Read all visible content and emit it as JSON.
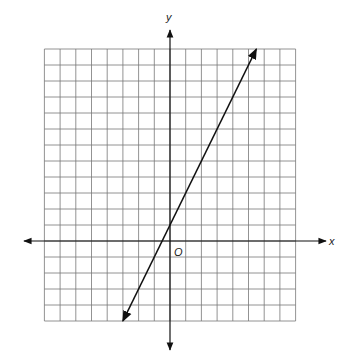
{
  "diagram": {
    "type": "coordinate-plane-line",
    "axes": {
      "x_label": "x",
      "y_label": "y",
      "origin_label": "O"
    },
    "grid": {
      "columns": 16,
      "rows": 17,
      "x_range": [
        -8,
        8
      ],
      "y_range": [
        -5,
        12
      ],
      "cell_width_px": 15.7,
      "cell_height_px": 16,
      "grid_color": "#777777"
    },
    "line": {
      "equation": "y = 2x + 1",
      "slope": 2,
      "y_intercept": 1,
      "x_intercept": -0.5,
      "endpoints": [
        [
          -3,
          -5
        ],
        [
          5.5,
          12
        ]
      ],
      "arrows": "both",
      "color": "#111111"
    }
  },
  "chart_data": {
    "type": "line",
    "title": "",
    "xlabel": "x",
    "ylabel": "y",
    "x": [
      -3,
      5.5
    ],
    "series": [
      {
        "name": "y = 2x + 1",
        "values": [
          -5,
          12
        ]
      }
    ],
    "xlim": [
      -8,
      8
    ],
    "ylim": [
      -5,
      12
    ],
    "grid": true
  }
}
